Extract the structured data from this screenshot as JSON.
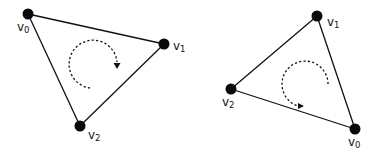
{
  "diagrams": [
    {
      "name": "triangle-clockwise",
      "winding": "clockwise",
      "vertices": [
        {
          "id": "v0",
          "letter": "v",
          "index": "0"
        },
        {
          "id": "v1",
          "letter": "v",
          "index": "1"
        },
        {
          "id": "v2",
          "letter": "v",
          "index": "2"
        }
      ]
    },
    {
      "name": "triangle-counterclockwise",
      "winding": "counterclockwise",
      "vertices": [
        {
          "id": "v0",
          "letter": "v",
          "index": "0"
        },
        {
          "id": "v1",
          "letter": "v",
          "index": "1"
        },
        {
          "id": "v2",
          "letter": "v",
          "index": "2"
        }
      ]
    }
  ],
  "colors": {
    "stroke": "#111111",
    "vertex": "#0a0a0a",
    "background": "#ffffff"
  }
}
